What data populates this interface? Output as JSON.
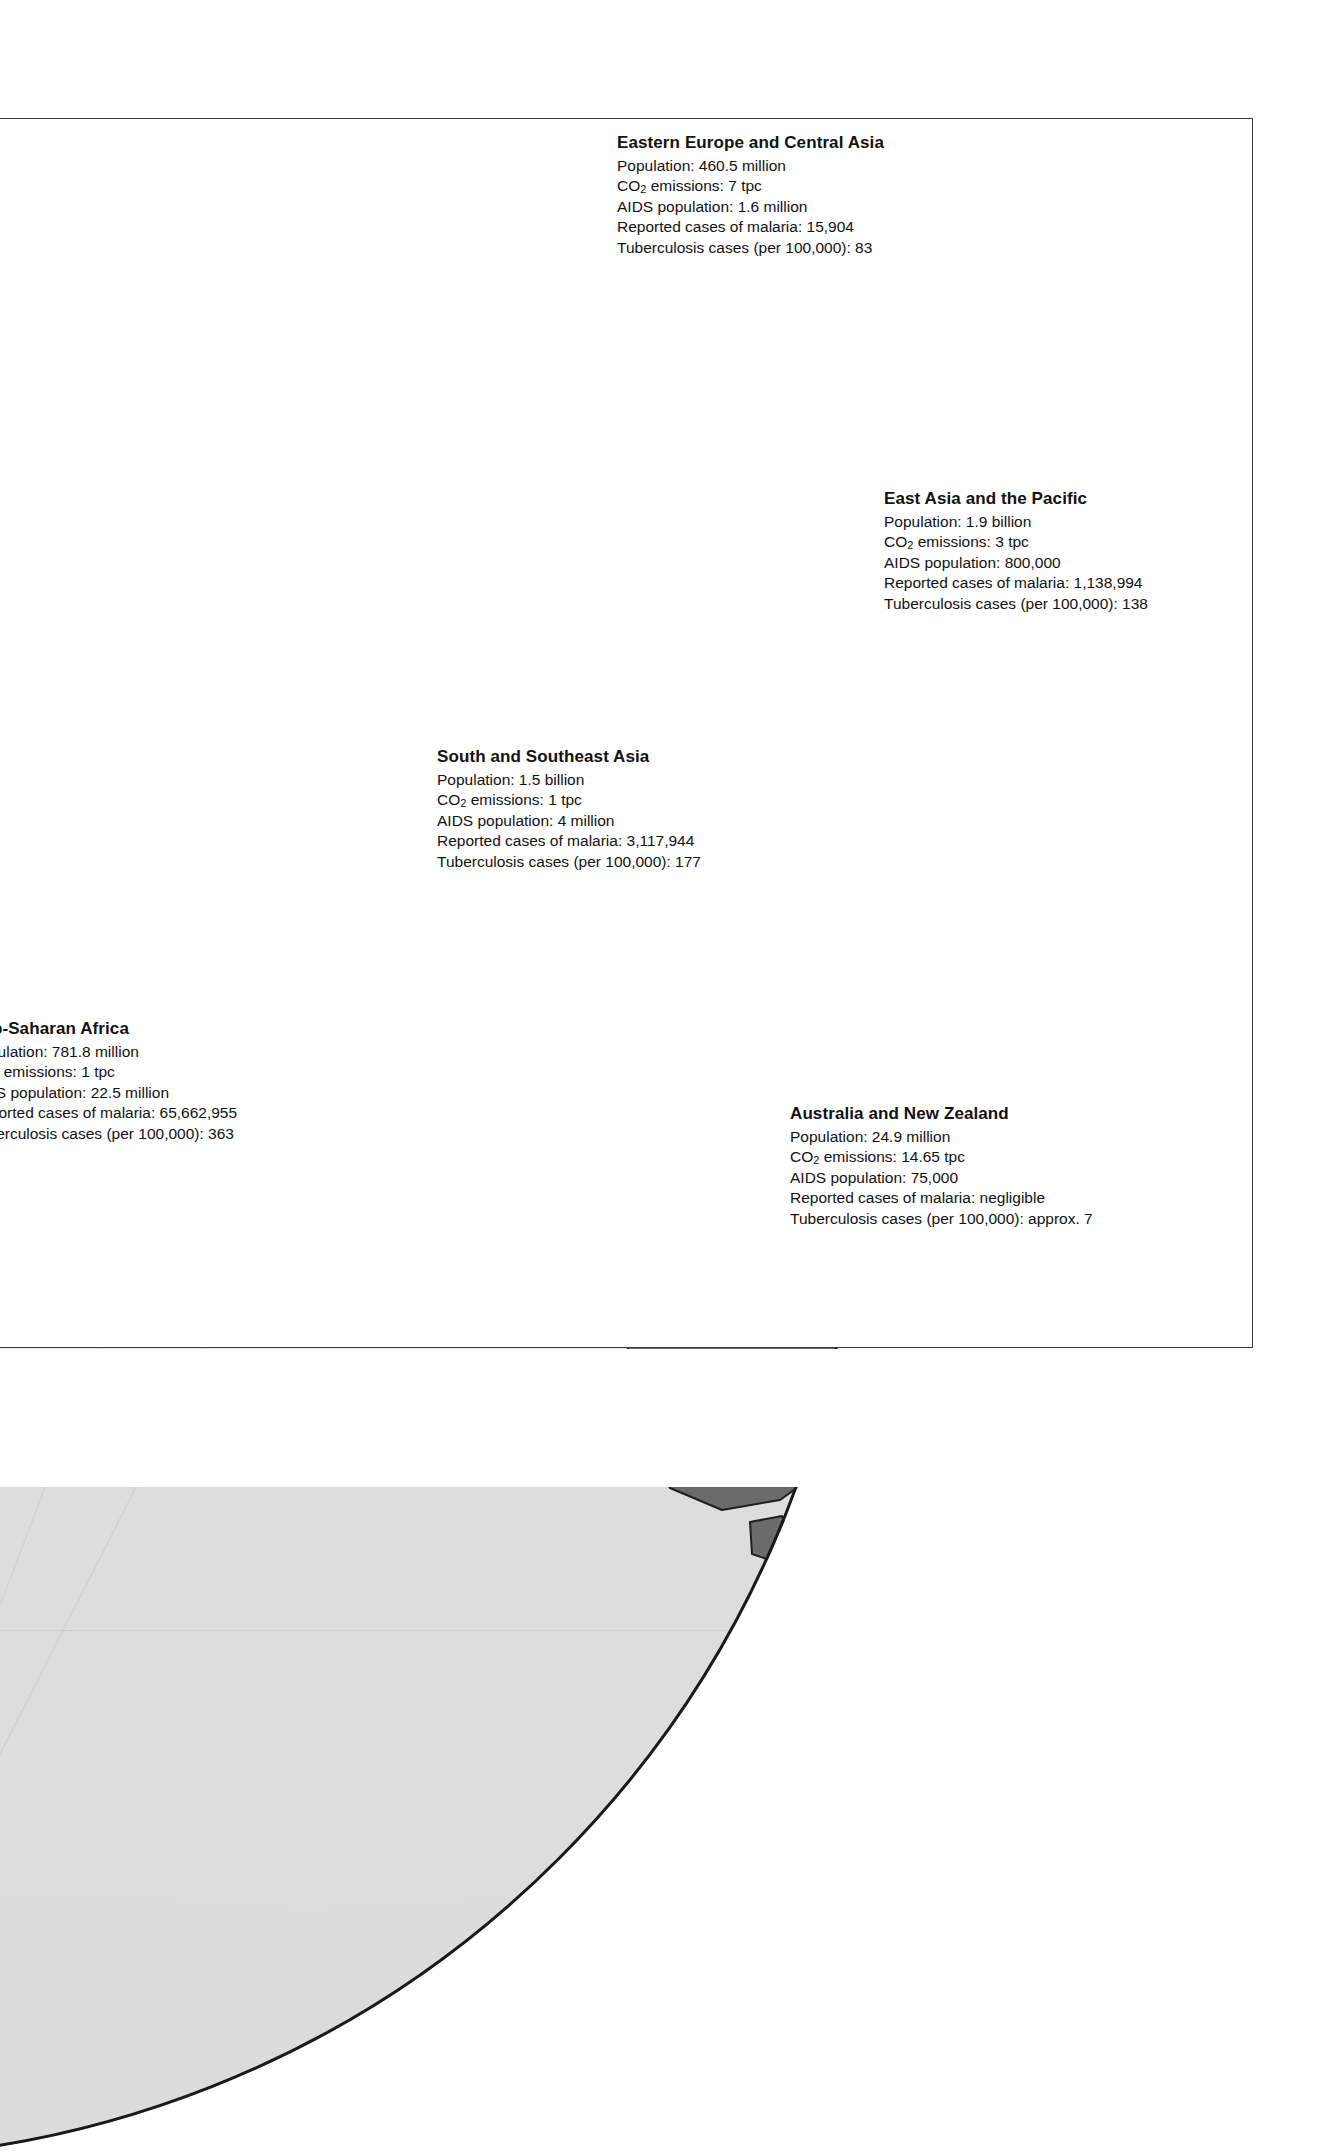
{
  "map": {
    "kind": "world-globe-projection",
    "projection_note": "orthographic globe centred on Eurasia, Africa and Australia",
    "colors": {
      "ocean": "#dddddd",
      "page_background": "#ffffff",
      "frame_line": "#3c3c3c",
      "globe_rim": "#1a1a1a",
      "graticule": "#c3c3c3",
      "region_eastern_europe_central_asia": "#5a5a5a",
      "region_western_europe": "#8a8a8a",
      "region_east_asia_pacific": "#b4b4b4",
      "region_east_asia_pacific_dark": "#6b6b6b",
      "region_south_southeast_asia": "#a3a3a3",
      "region_sub_saharan_africa": "#a8a8a8",
      "region_sub_saharan_africa_dark": "#7c7c7c",
      "region_australia_new_zealand": "#6b6b6b",
      "region_unshaded": "#f2f2f2",
      "country_border": "#1f1f1f"
    }
  },
  "labels": [
    {
      "id": "eastern-europe-central-asia",
      "title": "Eastern Europe and Central Asia",
      "population": "Population: 460.5 million",
      "co2_prefix": "CO",
      "co2_sub": "2",
      "co2_suffix": " emissions: 7 tpc",
      "aids": "AIDS population: 1.6 million",
      "malaria": "Reported cases of malaria: 15,904",
      "tuberculosis": "Tuberculosis cases (per 100,000): 83"
    },
    {
      "id": "east-asia-pacific",
      "title": "East Asia and the Pacific",
      "population": "Population: 1.9 billion",
      "co2_prefix": "CO",
      "co2_sub": "2",
      "co2_suffix": " emissions: 3 tpc",
      "aids": "AIDS population: 800,000",
      "malaria": "Reported cases of malaria: 1,138,994",
      "tuberculosis": "Tuberculosis cases (per 100,000): 138"
    },
    {
      "id": "south-southeast-asia",
      "title": "South and Southeast Asia",
      "population": "Population: 1.5 billion",
      "co2_prefix": "CO",
      "co2_sub": "2",
      "co2_suffix": " emissions: 1 tpc",
      "aids": "AIDS population: 4 million",
      "malaria": "Reported cases of malaria: 3,117,944",
      "tuberculosis": "Tuberculosis cases (per 100,000): 177"
    },
    {
      "id": "sub-saharan-africa",
      "title": "Sub-Saharan Africa",
      "population": "Population: 781.8 million",
      "co2_prefix": "CO",
      "co2_sub": "2",
      "co2_suffix": " emissions: 1 tpc",
      "aids": "AIDS population: 22.5 million",
      "malaria": "Reported cases of malaria: 65,662,955",
      "tuberculosis": "Tuberculosis cases (per 100,000): 363"
    },
    {
      "id": "australia-new-zealand",
      "title": "Australia and New Zealand",
      "population": "Population: 24.9 million",
      "co2_prefix": "CO",
      "co2_sub": "2",
      "co2_suffix": " emissions: 14.65 tpc",
      "aids": "AIDS population: 75,000",
      "malaria": "Reported cases of malaria: negligible",
      "tuberculosis": "Tuberculosis cases (per 100,000): approx. 7"
    }
  ]
}
